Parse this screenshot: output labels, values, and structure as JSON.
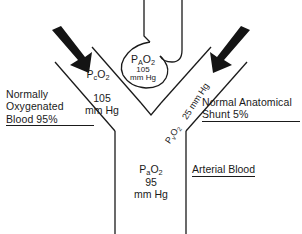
{
  "diagram": {
    "stroke_color": "#1a1a1a",
    "background_color": "#ffffff",
    "arrow_color": "#141414"
  },
  "alveolus": {
    "symbol_p": "P",
    "symbol_sub": "A",
    "symbol_o2": "O",
    "symbol_o2_sub": "2",
    "value": "105",
    "unit": "mm Hg"
  },
  "capillary": {
    "symbol_p": "P",
    "symbol_sub": "c",
    "symbol_o2": "O",
    "symbol_o2_sub": "2",
    "value": "105",
    "unit": "mm Hg"
  },
  "arterial": {
    "symbol_p": "P",
    "symbol_sub": "a",
    "symbol_o2": "O",
    "symbol_o2_sub": "2",
    "value": "95",
    "unit": "mm Hg",
    "label": "Arterial Blood"
  },
  "shunt_vessel": {
    "pressure_label": "25 mm Hg",
    "symbol_p": "P",
    "symbol_sub": "v",
    "symbol_o2": "O",
    "symbol_o2_sub": "2"
  },
  "left_label": {
    "line1": "Normally",
    "line2": "Oxygenated",
    "line3": "Blood 95%"
  },
  "right_label": {
    "line1": "Normal Anatomical",
    "line2": "Shunt 5%"
  },
  "arrows": [
    {
      "name": "left-inflow-arrow",
      "direction": "down-right"
    },
    {
      "name": "right-inflow-arrow",
      "direction": "down-left"
    }
  ]
}
